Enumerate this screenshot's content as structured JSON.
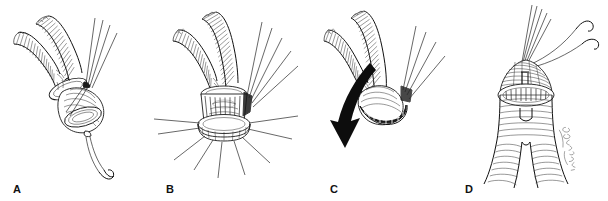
{
  "figure": {
    "style": "pen-and-ink line drawing",
    "background_color": "#ffffff",
    "ink_color": "#1a1a1a",
    "panel_count": 4
  },
  "panels": [
    {
      "id": "a",
      "label": "A",
      "caption": "Bifurcated corrugated graft limbs with everted cuff; parallel suture strands held at upper right and a suture with curved needle exiting below",
      "elements": {
        "graft_limbs": 2,
        "suture_strands_upper": 4,
        "needle": "curved-needle",
        "cuff": "oval anastomotic cuff"
      }
    },
    {
      "id": "b",
      "label": "B",
      "caption": "Graft seated on cylindrical cuff; interrupted sutures passed through and radiating outward around the circumference",
      "elements": {
        "graft_limbs": 2,
        "suture_strands_upper": 5,
        "radiating_sutures": 9,
        "cuff": "cylindrical basket cuff"
      }
    },
    {
      "id": "c",
      "label": "C",
      "caption": "Graft rotated and drawn downward (arrow) with the completed suture band visible on the cuff rim",
      "elements": {
        "graft_limbs": 2,
        "suture_strands_upper": 4,
        "arrow": "down-arrow",
        "suture_band": "dark stitched band"
      }
    },
    {
      "id": "d",
      "label": "D",
      "caption": "Completed anastomosis viewed from the front: dark hatched proximal hood above the suture line, graft body and limbs below; suture strands and curved needle at top right",
      "elements": {
        "graft_limbs": 2,
        "suture_strands_upper": 5,
        "needle": "curved-needle",
        "suture_line": "completed anastomotic suture line",
        "artist_signature": "artist signature"
      }
    }
  ]
}
